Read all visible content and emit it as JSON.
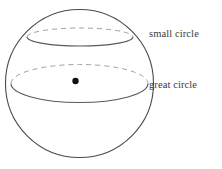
{
  "figure": {
    "background_color": "#ffffff",
    "width": 222,
    "height": 169
  },
  "labels": {
    "small_circle": "small circle",
    "great_circle": "great circle"
  },
  "colors": {
    "outline": "#4a4a4a",
    "solid_arc": "#595959",
    "hidden_arc": "#a0a0a0",
    "center_dot": "#111111",
    "label_text": "#3a3a3a",
    "background": "#ffffff"
  },
  "geometry": {
    "sphere": {
      "name": "sphere-outline",
      "center_x": 79.5,
      "center_y": 83.5,
      "radius": 74,
      "stroke_width": 1.1,
      "style": "solid"
    },
    "great_circle": {
      "name": "great-circle",
      "center_x": 79.5,
      "center_y": 83.5,
      "radius_x": 68.5,
      "radius_y": 19,
      "front_style": "solid",
      "back_style": "dashed",
      "dash_pattern": "5 4"
    },
    "small_circle": {
      "name": "small-circle",
      "center_x": 80,
      "center_y": 37,
      "radius_x": 53,
      "radius_y": 9,
      "front_style": "solid",
      "back_style": "dashed",
      "dash_pattern": "5 4"
    },
    "center_point": {
      "name": "sphere-center-dot",
      "x": 75.5,
      "y": 81,
      "radius": 3.2
    }
  }
}
